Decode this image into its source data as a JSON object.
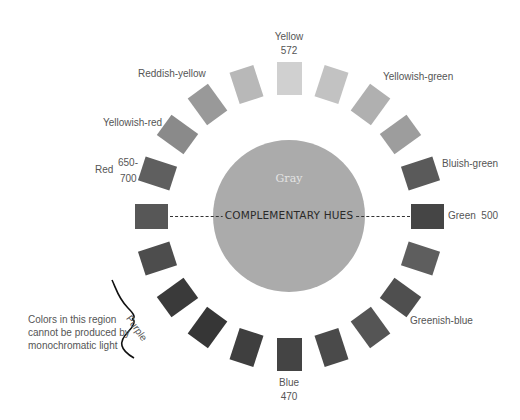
{
  "diagram": {
    "center_label": "Gray",
    "axis_label": "COMPLEMENTARY HUES",
    "labels": {
      "yellow": "Yellow",
      "yellow_nm": "572",
      "reddish_yellow": "Reddish-yellow",
      "yellowish_green": "Yellowish-green",
      "yellowish_red": "Yellowish-red",
      "bluish_green": "Bluish-green",
      "red": "Red",
      "red_nm_1": "650-",
      "red_nm_2": "700",
      "green": "Green  500",
      "greenish_blue": "Greenish-blue",
      "blue": "Blue",
      "blue_nm": "470",
      "purple": "Purple"
    },
    "note": [
      "Colors in this region",
      "cannot be produced by",
      "monochromatic light"
    ],
    "swatch_colors": [
      "#d0d0d0",
      "#c2c2c2",
      "#b0b0b0",
      "#9d9d9d",
      "#5a5a5a",
      "#454545",
      "#5e5e5e",
      "#4f4f4f",
      "#555555",
      "#4a4a4a",
      "#444444",
      "#3f3f3f",
      "#363636",
      "#3a3a3a",
      "#4d4d4d",
      "#575757",
      "#5f5f5f",
      "#8a8a8a",
      "#999999",
      "#b8b8b8"
    ]
  }
}
